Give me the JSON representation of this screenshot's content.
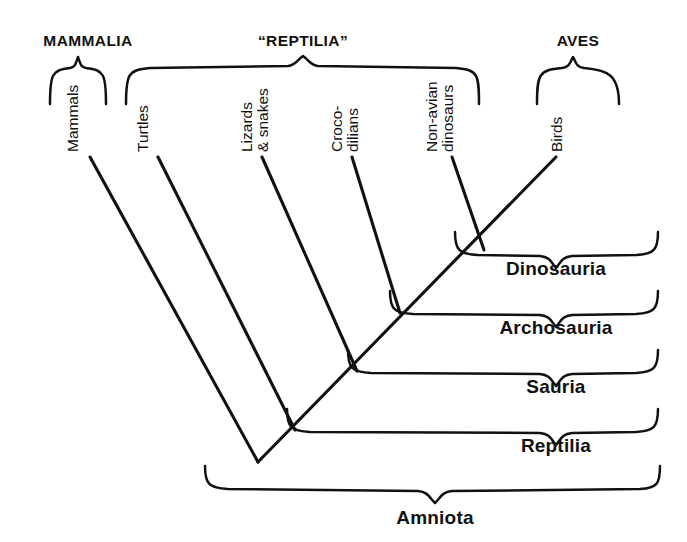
{
  "figure": {
    "type": "cladogram",
    "background_color": "#ffffff",
    "line_color": "#111111"
  },
  "top_groups": [
    {
      "id": "mammalia",
      "label": "MAMMALIA",
      "brace_left": 50,
      "brace_right": 106,
      "label_x": 88,
      "label_y": 46
    },
    {
      "id": "reptilia_quoted",
      "label": "“REPTILIA”",
      "brace_left": 126,
      "brace_right": 479,
      "label_x": 303,
      "label_y": 46
    },
    {
      "id": "aves",
      "label": "AVES",
      "brace_left": 537,
      "brace_right": 619,
      "label_x": 578,
      "label_y": 46
    }
  ],
  "taxa": [
    {
      "id": "mammals",
      "lines": [
        "Mammals"
      ],
      "label_x": 78,
      "label_y": 152,
      "tip_x": 90,
      "tip_y": 157
    },
    {
      "id": "turtles",
      "lines": [
        "Turtles"
      ],
      "label_x": 148,
      "label_y": 152,
      "tip_x": 158,
      "tip_y": 157
    },
    {
      "id": "lizards-snakes",
      "lines": [
        "Lizards",
        "& snakes"
      ],
      "label_x": 252,
      "label_y": 152,
      "tip_x": 262,
      "tip_y": 157
    },
    {
      "id": "crocodilians",
      "lines": [
        "Croco-",
        "dilians"
      ],
      "label_x": 342,
      "label_y": 152,
      "tip_x": 352,
      "tip_y": 157
    },
    {
      "id": "non-avian-dinosaurs",
      "lines": [
        "Non-avian",
        "dinosaurs"
      ],
      "label_x": 437,
      "label_y": 152,
      "tip_x": 452,
      "tip_y": 157
    },
    {
      "id": "birds",
      "lines": [
        "Birds"
      ],
      "label_x": 562,
      "label_y": 152,
      "tip_x": 556,
      "tip_y": 157
    }
  ],
  "clades": [
    {
      "id": "dinosauria",
      "label": "Dinosauria",
      "label_x": 556,
      "label_y": 275,
      "brace_top": 232,
      "brace_bottom": 300,
      "brace_left": 455,
      "brace_right": 658
    },
    {
      "id": "archosauria",
      "label": "Archosauria",
      "label_x": 556,
      "label_y": 334,
      "brace_top": 292,
      "brace_bottom": 360,
      "brace_left": 390,
      "brace_right": 658
    },
    {
      "id": "sauria",
      "label": "Sauria",
      "label_x": 556,
      "label_y": 393,
      "brace_top": 350,
      "brace_bottom": 418,
      "brace_left": 348,
      "brace_right": 658
    },
    {
      "id": "reptilia",
      "label": "Reptilia",
      "label_x": 556,
      "label_y": 452,
      "brace_top": 409,
      "brace_bottom": 478,
      "brace_left": 287,
      "brace_right": 658
    },
    {
      "id": "amniota",
      "label": "Amniota",
      "label_x": 435,
      "label_y": 518,
      "brace_left": 205,
      "brace_right": 660,
      "brace_y": 487
    }
  ],
  "nodes": [
    {
      "id": "root-amniota",
      "x": 258,
      "y": 462
    },
    {
      "id": "node-reptilia",
      "x": 295,
      "y": 430
    },
    {
      "id": "node-sauria",
      "x": 357,
      "y": 371
    },
    {
      "id": "node-archosauria",
      "x": 400,
      "y": 313
    },
    {
      "id": "node-dinosauria",
      "x": 484,
      "y": 250
    }
  ]
}
